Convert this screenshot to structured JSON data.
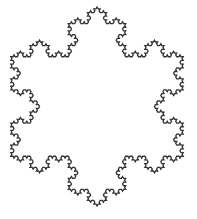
{
  "figure": {
    "subject": "Koch snowflake",
    "iterations": 4,
    "center": [
      97,
      106.5
    ],
    "radius": 99.5,
    "orientation_deg": 90,
    "stroke_color": "#333333",
    "stroke_width": 1.3,
    "background": "#ffffff"
  }
}
